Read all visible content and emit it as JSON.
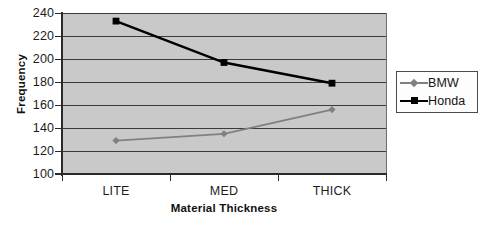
{
  "chart_data": {
    "type": "line",
    "title": "",
    "xlabel": "Material Thickness",
    "ylabel": "Frequency",
    "categories": [
      "LITE",
      "MED",
      "THICK"
    ],
    "series": [
      {
        "name": "BMW",
        "values": [
          129,
          135,
          156
        ],
        "color": "#808080",
        "marker": "diamond"
      },
      {
        "name": "Honda",
        "values": [
          233,
          197,
          179
        ],
        "color": "#000000",
        "marker": "square"
      }
    ],
    "ylim": [
      100,
      240
    ],
    "ytick_step": 20,
    "yticks": [
      240,
      220,
      200,
      180,
      160,
      140,
      120,
      100
    ],
    "grid": "horizontal",
    "legend_position": "right",
    "plot_background": "#c9c9c9",
    "figure_background": "#ffffff"
  },
  "legend": {
    "entries": [
      {
        "label": "BMW"
      },
      {
        "label": "Honda"
      }
    ]
  },
  "axes": {
    "y_title": "Frequency",
    "x_title": "Material Thickness"
  }
}
